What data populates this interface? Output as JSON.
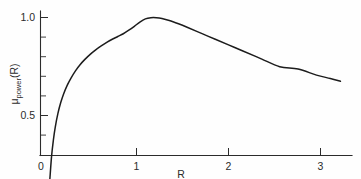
{
  "chart_data": {
    "type": "line",
    "title": "",
    "xlabel": "R",
    "ylabel": "μ power (R)",
    "ylabel_parts": {
      "symbol": "μ",
      "subscript": "power",
      "argument": "(R)"
    },
    "xlim": [
      0,
      3.34
    ],
    "ylim": [
      0,
      1.1
    ],
    "grid": false,
    "legend": null,
    "xticks": [
      0,
      1,
      2,
      3
    ],
    "xticklabels": [
      "0",
      "1",
      "2",
      "3"
    ],
    "yticks": [
      0.5,
      1.0
    ],
    "yticklabels": [
      "0.5",
      "1.0"
    ],
    "y_minor_tick_step": 0.1,
    "series": [
      {
        "name": "mu_power",
        "color": "#1c1c1c",
        "x": [
          0.085,
          0.1,
          0.12,
          0.14,
          0.16,
          0.19,
          0.22,
          0.25,
          0.29,
          0.33,
          0.38,
          0.43,
          0.48,
          0.54,
          0.6,
          0.66,
          0.72,
          0.78,
          0.84,
          0.9,
          0.96,
          1.02,
          1.08,
          1.14,
          1.2,
          1.26,
          1.32,
          1.4,
          1.5,
          1.6,
          1.75,
          1.9,
          2.05,
          2.2,
          2.4,
          2.6,
          2.8,
          3.0,
          3.15,
          3.26
        ],
        "y": [
          0.075,
          0.165,
          0.29,
          0.375,
          0.44,
          0.512,
          0.566,
          0.609,
          0.654,
          0.69,
          0.728,
          0.759,
          0.785,
          0.812,
          0.835,
          0.855,
          0.873,
          0.889,
          0.903,
          0.917,
          0.935,
          0.955,
          0.977,
          0.993,
          0.999,
          0.999,
          0.995,
          0.985,
          0.968,
          0.949,
          0.919,
          0.889,
          0.859,
          0.829,
          0.789,
          0.749,
          0.737,
          0.706,
          0.689,
          0.675
        ]
      }
    ],
    "annotations": {
      "peak_value": 1.0,
      "peak_position_R": 1.22,
      "start_position_R": 0.085,
      "end_value": 0.675,
      "end_position_R": 3.26
    }
  },
  "axes": {
    "x_axis_name": "R",
    "y_axis_name": "μ power (R)"
  }
}
